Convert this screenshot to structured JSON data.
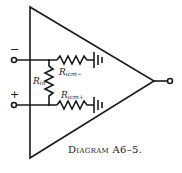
{
  "diagram": {
    "caption": "Diagram A6–5.",
    "colors": {
      "stroke": "#1a1a1a",
      "background": "#ffffff"
    },
    "inputs": {
      "inverting": {
        "sign": "−"
      },
      "noninverting": {
        "sign": "+"
      }
    },
    "components": {
      "r_in": {
        "name": "R",
        "sub": "in"
      },
      "r_icm_minus": {
        "name": "R",
        "sub": "icm−"
      },
      "r_icm_plus": {
        "name": "R",
        "sub": "icm+"
      }
    },
    "symbols": [
      "triangle-amplifier",
      "resistor",
      "resistor",
      "resistor",
      "ground",
      "ground",
      "input-terminal",
      "input-terminal",
      "output-terminal"
    ]
  }
}
